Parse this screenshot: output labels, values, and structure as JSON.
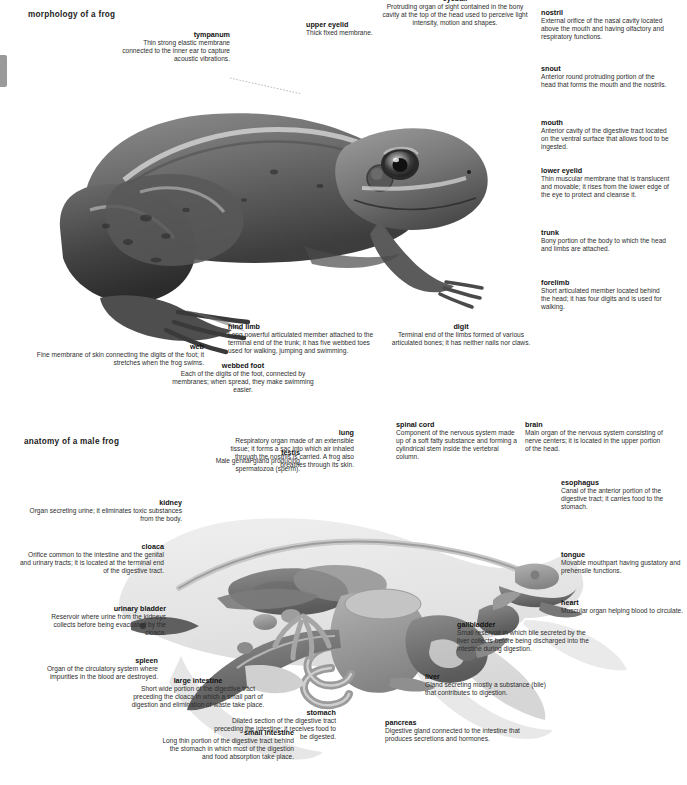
{
  "document": {
    "sections": [
      {
        "id": "morphology",
        "title": "morphology of a frog"
      },
      {
        "id": "anatomy",
        "title": "anatomy of a male frog"
      }
    ],
    "palette": {
      "text": "#2e2e2e",
      "heading": "#111111",
      "leader_line": "#7d7d7d",
      "photo_dark": "#3a3a3a",
      "photo_mid": "#6f6f6f",
      "photo_light": "#a8a8a8",
      "anatomy_body": "#e2e2e2",
      "anatomy_organ_dark": "#6b6b6b",
      "anatomy_organ_mid": "#959595",
      "edge_tab": "#9a9a9a"
    }
  },
  "morphology": {
    "title": "morphology of a frog",
    "labels": [
      {
        "id": "tympanum",
        "term": "tympanum",
        "description": "Thin strong elastic membrane connected to the inner ear to capture acoustic vibrations."
      },
      {
        "id": "upper-eyelid",
        "term": "upper eyelid",
        "description": "Thick fixed membrane."
      },
      {
        "id": "eyeball",
        "term": "eyeball",
        "description": "Protruding organ of sight contained in the bony cavity at the top of the head used to perceive light intensity, motion and shapes."
      },
      {
        "id": "nostril",
        "term": "nostril",
        "description": "External orifice of the nasal cavity located above the mouth and having olfactory and respiratory functions."
      },
      {
        "id": "snout",
        "term": "snout",
        "description": "Anterior round protruding portion of the head that forms the mouth and the nostrils."
      },
      {
        "id": "mouth",
        "term": "mouth",
        "description": "Anterior cavity of the digestive tract located on the ventral surface that allows food to be ingested."
      },
      {
        "id": "lower-eyelid",
        "term": "lower eyelid",
        "description": "Thin muscular membrane that is translucent and movable; it rises from the lower edge of the eye to protect and cleanse it."
      },
      {
        "id": "trunk",
        "term": "trunk",
        "description": "Bony portion of the body to which the head and limbs are attached."
      },
      {
        "id": "forelimb",
        "term": "forelimb",
        "description": "Short articulated member located behind the head; it has four digits and is used for walking."
      },
      {
        "id": "digit",
        "term": "digit",
        "description": "Terminal end of the limbs formed of various articulated bones; it has neither nails nor claws."
      },
      {
        "id": "hind-limb",
        "term": "hind limb",
        "description": "Long powerful articulated member attached to the terminal end of the trunk; it has five webbed toes used for walking, jumping and swimming."
      },
      {
        "id": "webbed-foot",
        "term": "webbed foot",
        "description": "Each of the digits of the foot, connected by membranes; when spread, they make swimming easier."
      },
      {
        "id": "web",
        "term": "web",
        "description": "Fine membrane of skin connecting the digits of the foot; it stretches when the frog swims."
      }
    ]
  },
  "anatomy": {
    "title": "anatomy of a male frog",
    "labels": [
      {
        "id": "testis",
        "term": "testis",
        "description": "Male genital gland producing spermatozoa (sperm)."
      },
      {
        "id": "lung",
        "term": "lung",
        "description": "Respiratory organ made of an extensible tissue; it forms a sac into which air inhaled through the nostrils is carried. A frog also breathes through its skin."
      },
      {
        "id": "spinal-cord",
        "term": "spinal cord",
        "description": "Component of the nervous system made up of a soft fatty substance and forming a cylindrical stem inside the vertebral column."
      },
      {
        "id": "brain",
        "term": "brain",
        "description": "Main organ of the nervous system consisting of nerve centers; it is located in the upper portion of the head."
      },
      {
        "id": "esophagus",
        "term": "esophagus",
        "description": "Canal of the anterior portion of the digestive tract; it carries food to the stomach."
      },
      {
        "id": "tongue",
        "term": "tongue",
        "description": "Movable mouthpart having gustatory and prehensile functions."
      },
      {
        "id": "heart",
        "term": "heart",
        "description": "Muscular organ helping blood to circulate."
      },
      {
        "id": "gallbladder",
        "term": "gallbladder",
        "description": "Small reservoir in which bile secreted by the liver collects before being discharged into the intestine during digestion."
      },
      {
        "id": "liver",
        "term": "liver",
        "description": "Gland secreting mostly a substance (bile) that contributes to digestion."
      },
      {
        "id": "pancreas",
        "term": "pancreas",
        "description": "Digestive gland connected to the intestine that produces secretions and hormones."
      },
      {
        "id": "stomach",
        "term": "stomach",
        "description": "Dilated section of the digestive tract preceding the intestine; it receives food to be digested."
      },
      {
        "id": "small-intestine",
        "term": "small intestine",
        "description": "Long thin portion of the digestive tract behind the stomach in which most of the digestion and food absorption take place."
      },
      {
        "id": "large-intestine",
        "term": "large intestine",
        "description": "Short wide portion of the digestive tract preceding the cloaca in which a small part of digestion and elimination of waste take place."
      },
      {
        "id": "spleen",
        "term": "spleen",
        "description": "Organ of the circulatory system where impurities in the blood are destroyed."
      },
      {
        "id": "urinary-bladder",
        "term": "urinary bladder",
        "description": "Reservoir where urine from the kidneys collects before being evacuated by the cloaca."
      },
      {
        "id": "cloaca",
        "term": "cloaca",
        "description": "Orifice common to the intestine and the genital and urinary tracts; it is located at the terminal end of the digestive tract."
      },
      {
        "id": "kidney",
        "term": "kidney",
        "description": "Organ secreting urine; it eliminates toxic substances from the body."
      }
    ]
  }
}
